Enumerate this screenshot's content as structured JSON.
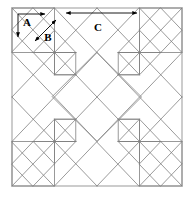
{
  "figure": {
    "type": "geometric-diagram",
    "background_color": "#ffffff",
    "line_color": "#808080",
    "arrow_color": "#000000",
    "outer_square": {
      "x": 12,
      "y": 8,
      "width": 170,
      "height": 178
    },
    "grid": {
      "columns": 4,
      "rows": 4,
      "cell_width": 42.5,
      "cell_height": 44.5
    }
  },
  "labels": {
    "a": {
      "text": "A",
      "x": 27,
      "y": 25,
      "meaning": "small-square-side"
    },
    "b": {
      "text": "B",
      "x": 47,
      "y": 38,
      "meaning": "small-square-diagonal"
    },
    "c": {
      "text": "C",
      "x": 97,
      "y": 30,
      "meaning": "half-block-width"
    }
  },
  "dimension_arrows": {
    "a_horizontal": {
      "name": "A-horizontal-arrow",
      "x1": 18,
      "y1": 14,
      "x2": 46,
      "y2": 14
    },
    "a_vertical": {
      "name": "A-vertical-arrow",
      "x1": 18,
      "y1": 14,
      "x2": 18,
      "y2": 38
    },
    "b_diagonal": {
      "name": "B-diagonal-double-arrow",
      "x1": 34,
      "y1": 42,
      "x2": 57,
      "y2": 20
    },
    "c_span": {
      "name": "C-double-arrow",
      "x1": 64,
      "y1": 13,
      "x2": 139,
      "y2": 13
    }
  },
  "geometry": {
    "outline_points": "12,8 182,8 182,186 12,186",
    "note": "Diamond lattice formed by diagonal lines at 45 degrees across a 4x4 grid; corner blocks contain nested triangles and small squares."
  }
}
